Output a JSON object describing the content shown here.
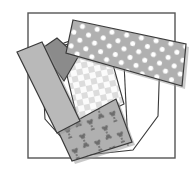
{
  "figure": {
    "canvas": {
      "width": 192,
      "height": 169,
      "background": "#ffffff"
    },
    "colors": {
      "outline": "#3a3a3a",
      "frame_stroke": "#555555",
      "light_gray": "#b9b9b9",
      "mid_gray": "#adadad",
      "dark_gray": "#8b8b8b",
      "dot_gray": "#b0b0b0",
      "check_light": "#fbfbfb",
      "check_square": "#dcdcdc",
      "x_field": "#b0b0b0",
      "x_motif": "#6d6d6d",
      "white": "#ffffff",
      "shadow": "#9a9a9a"
    },
    "frame": {
      "name": "outer-frame",
      "x": 28,
      "y": 13,
      "width": 147,
      "height": 145,
      "stroke_width": 1.4
    },
    "shapes": [
      {
        "name": "white-base-polygon",
        "fill_key": "white",
        "pattern": "none",
        "points": "42,64 64,43 101,30 160,55 158,116 133,150 78,156 45,119"
      },
      {
        "name": "checkered-patch",
        "fill_key": "check_light",
        "pattern": "checkerboard",
        "points": "60,46 105,36 124,104 79,126"
      },
      {
        "name": "dark-gray-wedge",
        "fill_key": "dark_gray",
        "pattern": "none",
        "points": "41,49 57,38 78,57 64,81"
      },
      {
        "name": "left-gray-strip",
        "fill_key": "light_gray",
        "pattern": "none",
        "points": "17,52 42,42 80,121 57,133"
      },
      {
        "name": "x-motif-patch",
        "fill_key": "x_field",
        "pattern": "x-motif",
        "points": "58,131 116,99 132,142 72,161"
      },
      {
        "name": "polka-dot-band",
        "fill_key": "dot_gray",
        "pattern": "polka-dots",
        "points": "73,20 186,44 182,86 66,53"
      }
    ],
    "divider_lines": [
      {
        "name": "white-polygon-divider",
        "x1": 124,
        "y1": 63,
        "x2": 128,
        "y2": 146
      }
    ],
    "dots": {
      "name": "polka-dot-set",
      "radius": 2.6,
      "fill_key": "white",
      "count": 26
    },
    "check_squares": {
      "name": "checkerboard-square-set",
      "size": 6,
      "fill_key": "check_square",
      "count": 21
    },
    "x_motifs": {
      "name": "x-pinwheel-set",
      "fill_key": "x_motif",
      "count": 9
    }
  }
}
